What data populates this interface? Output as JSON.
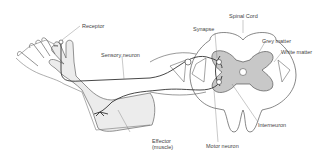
{
  "diagram": {
    "labels": {
      "receptor": "Receptor",
      "sensory_neuron": "Sensory neuron",
      "synapse": "Synapse",
      "spinal_cord": "Spinal Cord",
      "grey_matter": "Grey matter",
      "white_matter": "White matter",
      "interneuron": "Interneuron",
      "motor_neuron": "Motor neuron",
      "effector_line1": "Effector",
      "effector_line2": "(muscle)"
    },
    "colors": {
      "outline": "#555555",
      "fill_arm": "#ececec",
      "fill_grey_matter": "#c8c8c8",
      "nerve": "#333333"
    }
  }
}
